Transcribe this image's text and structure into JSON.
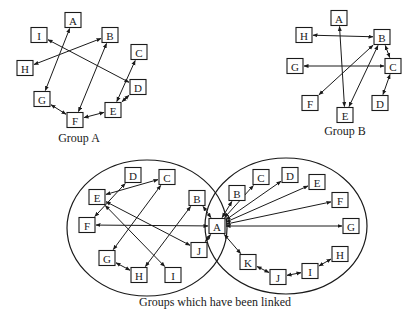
{
  "colors": {
    "stroke": "#1a1a1a",
    "background": "#ffffff"
  },
  "groups": [
    {
      "id": "groupA",
      "label": "Group A",
      "label_pos": [
        79,
        142
      ],
      "nodes": [
        {
          "id": "A",
          "x": 73,
          "y": 20
        },
        {
          "id": "I",
          "x": 39,
          "y": 35
        },
        {
          "id": "B",
          "x": 110,
          "y": 35
        },
        {
          "id": "H",
          "x": 25,
          "y": 68
        },
        {
          "id": "C",
          "x": 139,
          "y": 52
        },
        {
          "id": "D",
          "x": 138,
          "y": 87
        },
        {
          "id": "G",
          "x": 42,
          "y": 99
        },
        {
          "id": "E",
          "x": 113,
          "y": 110
        },
        {
          "id": "F",
          "x": 75,
          "y": 120
        }
      ],
      "edges": [
        [
          "A",
          "G"
        ],
        [
          "B",
          "H"
        ],
        [
          "I",
          "D"
        ],
        [
          "B",
          "F"
        ],
        [
          "C",
          "E"
        ],
        [
          "D",
          "E"
        ],
        [
          "E",
          "F"
        ],
        [
          "G",
          "F"
        ]
      ]
    },
    {
      "id": "groupB",
      "label": "Group B",
      "label_pos": [
        345,
        135
      ],
      "nodes": [
        {
          "id": "A",
          "x": 339,
          "y": 18
        },
        {
          "id": "H",
          "x": 304,
          "y": 35
        },
        {
          "id": "B",
          "x": 382,
          "y": 37
        },
        {
          "id": "G",
          "x": 295,
          "y": 66
        },
        {
          "id": "C",
          "x": 393,
          "y": 66
        },
        {
          "id": "F",
          "x": 310,
          "y": 103
        },
        {
          "id": "D",
          "x": 380,
          "y": 103
        },
        {
          "id": "E",
          "x": 345,
          "y": 115
        }
      ],
      "edges": [
        [
          "H",
          "B"
        ],
        [
          "A",
          "E"
        ],
        [
          "B",
          "C"
        ],
        [
          "G",
          "C"
        ],
        [
          "B",
          "F"
        ],
        [
          "B",
          "E"
        ],
        [
          "C",
          "D"
        ]
      ]
    },
    {
      "id": "linked",
      "label": "Groups which have been linked",
      "label_pos": [
        215,
        306
      ],
      "ellipses": [
        {
          "cx": 147,
          "cy": 228,
          "rx": 80,
          "ry": 68
        },
        {
          "cx": 286,
          "cy": 226,
          "rx": 81,
          "ry": 68
        }
      ],
      "nodes": [
        {
          "id": "D",
          "key": "LD",
          "x": 133,
          "y": 175
        },
        {
          "id": "C",
          "key": "LC",
          "x": 167,
          "y": 177
        },
        {
          "id": "E",
          "key": "LE",
          "x": 97,
          "y": 197
        },
        {
          "id": "B",
          "key": "LB",
          "x": 197,
          "y": 198
        },
        {
          "id": "F",
          "key": "LF",
          "x": 87,
          "y": 225
        },
        {
          "id": "A",
          "key": "A",
          "x": 217,
          "y": 226
        },
        {
          "id": "J",
          "key": "LJ",
          "x": 199,
          "y": 250
        },
        {
          "id": "G",
          "key": "LG",
          "x": 107,
          "y": 258
        },
        {
          "id": "H",
          "key": "LH",
          "x": 139,
          "y": 275
        },
        {
          "id": "I",
          "key": "LI",
          "x": 173,
          "y": 275
        },
        {
          "id": "B",
          "key": "RB",
          "x": 237,
          "y": 193
        },
        {
          "id": "C",
          "key": "RC",
          "x": 261,
          "y": 177
        },
        {
          "id": "D",
          "key": "RD",
          "x": 290,
          "y": 175
        },
        {
          "id": "E",
          "key": "RE",
          "x": 317,
          "y": 182
        },
        {
          "id": "F",
          "key": "RF",
          "x": 340,
          "y": 200
        },
        {
          "id": "G",
          "key": "RG",
          "x": 351,
          "y": 226
        },
        {
          "id": "K",
          "key": "RK",
          "x": 248,
          "y": 262
        },
        {
          "id": "H",
          "key": "RH",
          "x": 340,
          "y": 254
        },
        {
          "id": "I",
          "key": "RI",
          "x": 310,
          "y": 271
        },
        {
          "id": "J",
          "key": "RJ",
          "x": 278,
          "y": 277
        }
      ],
      "edges": [
        [
          "LE",
          "LC"
        ],
        [
          "LD",
          "LF"
        ],
        [
          "LC",
          "LG"
        ],
        [
          "LE",
          "LJ"
        ],
        [
          "LE",
          "LI"
        ],
        [
          "LB",
          "LH"
        ],
        [
          "A",
          "LF"
        ],
        [
          "A",
          "LB"
        ],
        [
          "A",
          "LJ"
        ],
        [
          "LG",
          "LH"
        ],
        [
          "A",
          "RB"
        ],
        [
          "A",
          "RC"
        ],
        [
          "A",
          "RD"
        ],
        [
          "A",
          "RE"
        ],
        [
          "A",
          "RF"
        ],
        [
          "A",
          "RG"
        ],
        [
          "A",
          "RK"
        ],
        [
          "RK",
          "RJ"
        ],
        [
          "RJ",
          "RI"
        ],
        [
          "RI",
          "RH"
        ]
      ]
    }
  ]
}
